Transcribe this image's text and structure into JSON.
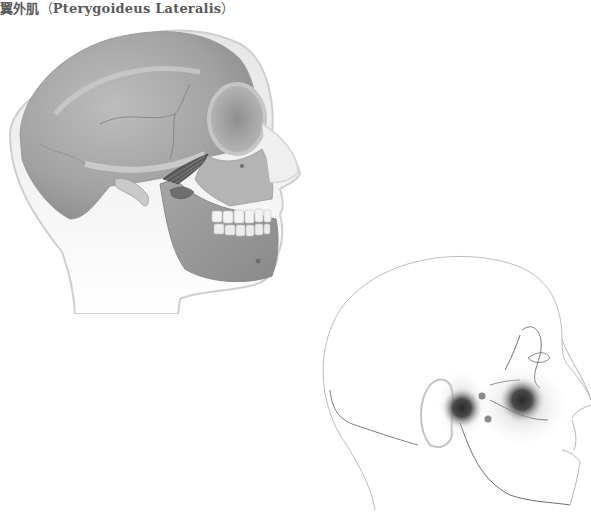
{
  "page": {
    "title_cn": "翼外肌",
    "title_open_paren": "（",
    "title_latin": "Pterygoideus Lateralis",
    "title_close_paren": "）"
  },
  "figures": [
    {
      "id": "skull",
      "description": "Lateral view of skull inside head outline showing lateral pterygoid muscle",
      "style": "grayscale shaded illustration"
    },
    {
      "id": "pain-pattern",
      "description": "Head outline with referred pain zones at TMJ and maxillary area, two trigger point dots",
      "style": "line drawing with gray blurred zones"
    }
  ],
  "colors": {
    "title": "#5a5a5a",
    "skull_bone": "#a8a8a8",
    "skull_dark": "#7d7d7d",
    "head_outline": "#c8c8c8",
    "pain_zone": "#2f2f2f",
    "trigger_dot": "#8a8a8a",
    "line": "#9a9a9a"
  }
}
